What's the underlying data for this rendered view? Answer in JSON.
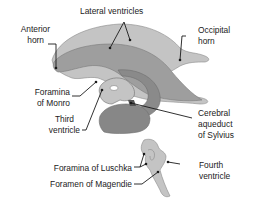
{
  "diagram": {
    "colors": {
      "light": "#c4c4c4",
      "mid": "#9e9e9e",
      "dark": "#878787",
      "outline": "#6e6e6e",
      "leader": "#1a1a1a"
    },
    "labels": {
      "lateral_ventricles": "Lateral ventricles",
      "anterior_horn_1": "Anterior",
      "anterior_horn_2": "horn",
      "occipital_horn_1": "Occipital",
      "occipital_horn_2": "horn",
      "foramina_monro_1": "Foramina",
      "foramina_monro_2": "of Monro",
      "third_ventricle_1": "Third",
      "third_ventricle_2": "ventricle",
      "aqueduct_1": "Cerebral",
      "aqueduct_2": "aqueduct",
      "aqueduct_3": "of Sylvius",
      "luschka": "Foramina of Luschka",
      "magendie": "Foramen of Magendie",
      "fourth_ventricle_1": "Fourth",
      "fourth_ventricle_2": "ventricle"
    }
  }
}
